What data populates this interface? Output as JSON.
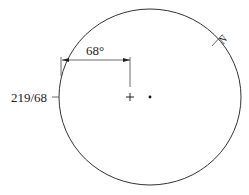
{
  "diagram": {
    "type": "stereonet-plane-plot",
    "primitive_circle": {
      "center": [
        150,
        97
      ],
      "radius_x": 91,
      "radius_y": 88,
      "stroke": "#333333"
    },
    "north_mark": {
      "label": "N",
      "position": [
        222,
        40
      ],
      "angle_deg": -50
    },
    "center_cross": {
      "symbol": "+",
      "position": [
        130,
        97
      ]
    },
    "center_dot": {
      "position": [
        150,
        97
      ]
    },
    "angle_dimension": {
      "label": "68°",
      "y": 60,
      "x_start": 62,
      "x_end": 130
    },
    "plane_label": {
      "text": "219/68",
      "position": [
        16,
        102
      ]
    }
  }
}
